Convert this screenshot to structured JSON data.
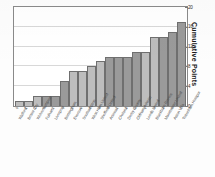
{
  "chart_data": {
    "type": "bar",
    "title": "",
    "xlabel": "",
    "ylabel": "Cumulative Points",
    "ylim": [
      0,
      20
    ],
    "yticks": [
      0,
      4,
      8,
      12,
      16,
      20
    ],
    "grid": true,
    "legend": "none",
    "categories": [
      "Watford",
      "Bristol City",
      "Wolverhampton",
      "Fulham",
      "Liverpool",
      "Birmingham",
      "Everton",
      "Southampton",
      "West Ham United",
      "Sheffield United",
      "Arsenal",
      "Chelsea",
      "Derby County",
      "Oldham Athletic",
      "Leeds United",
      "Blackburn Rovers",
      "Manchester United",
      "Aston Villa",
      "Tottenham Hotspur"
    ],
    "values": [
      1,
      1,
      2,
      2,
      2,
      5,
      7,
      7,
      8,
      9,
      10,
      10,
      10,
      11,
      11,
      14,
      14,
      15,
      17
    ],
    "point_labels": [
      "0",
      "1",
      "1",
      "0",
      "1",
      "0",
      "1",
      "0",
      "1",
      "0",
      "0",
      "1",
      "1",
      "0",
      "1",
      "0",
      "1",
      "0",
      "1"
    ],
    "bar_shades": [
      "light",
      "light",
      "light",
      "dark",
      "dark",
      "dark",
      "light",
      "light",
      "light",
      "light",
      "dark",
      "dark",
      "dark",
      "dark",
      "light",
      "light",
      "dark",
      "dark",
      "dark"
    ],
    "colors": {
      "bar_light": "#bdbdbd",
      "bar_dark": "#9a9a9a",
      "bar_border": "#6f6f6f",
      "gridline": "#d8d8d8",
      "frame": "#8a8a8a",
      "text": "#2b2b2b"
    }
  }
}
